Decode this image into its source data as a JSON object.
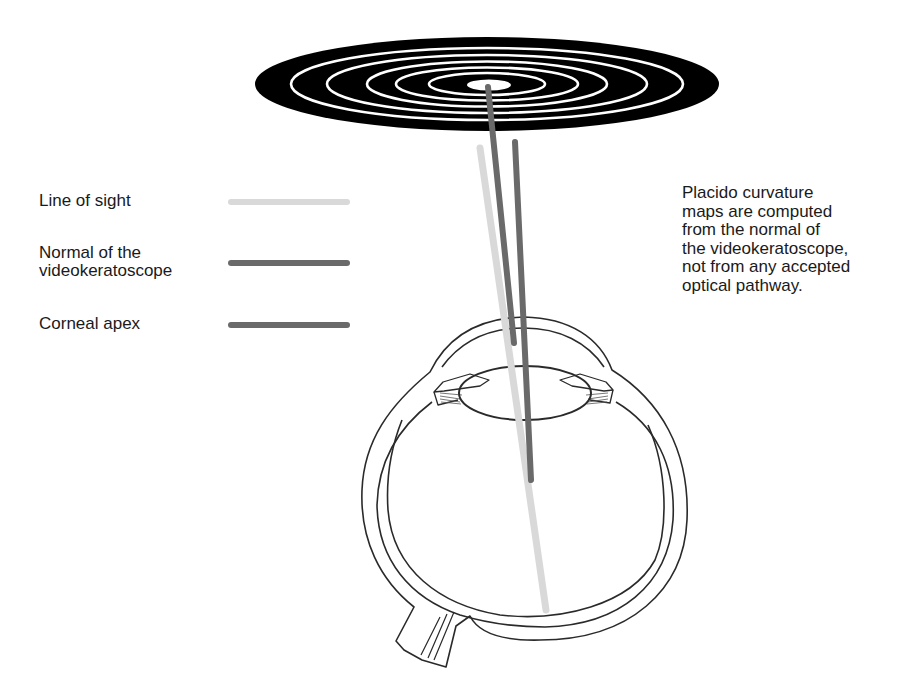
{
  "diagram": {
    "placido_disc": {
      "label": "placido-disc",
      "rings": 5,
      "fill_color": "#000000",
      "ring_color": "#ffffff"
    },
    "legend": {
      "items": [
        {
          "label": "Line of sight",
          "color": "#d9d9d9"
        },
        {
          "label_line1": "Normal of the",
          "label_line2": "videokeratoscope",
          "color": "#6a6a6a"
        },
        {
          "label": "Corneal apex",
          "color": "#6a6a6a"
        }
      ]
    },
    "note": {
      "lines": [
        "Placido curvature",
        "maps are computed",
        "from the normal of",
        "the videokeratoscope,",
        "not from any accepted",
        "optical pathway."
      ]
    },
    "colors": {
      "line_of_sight": "#d9d9d9",
      "normal": "#6a6a6a",
      "corneal_apex": "#6a6a6a",
      "eye_outline": "#2a2a2a"
    }
  }
}
